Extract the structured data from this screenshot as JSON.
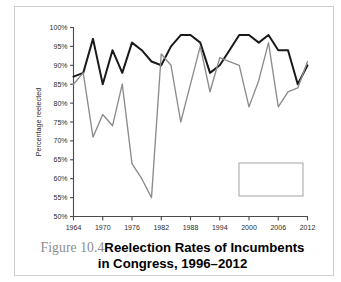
{
  "figure": {
    "caption_label": "Figure 10.4",
    "caption_title_line1": "Reelection Rates of Incumbents",
    "caption_title_line2": "in Congress, 1996–2012"
  },
  "colors": {
    "house": "#1a1a1a",
    "senate": "#8c8c8c",
    "axis": "#4a4a4a",
    "frame": "#cfcfcf",
    "background": "#ffffff",
    "caption_label": "#8d8d8d",
    "caption_title": "#000000"
  },
  "legend": {
    "position": "bottom-right",
    "entries": [
      {
        "label": "House",
        "color": "#1a1a1a"
      },
      {
        "label": "Senate",
        "color": "#8c8c8c"
      }
    ]
  },
  "chart_data": {
    "type": "line",
    "title": "Reelection Rates of Incumbents in Congress, 1996–2012",
    "xlabel": "",
    "ylabel": "Percentage reelected",
    "xlim": [
      1964,
      2012
    ],
    "ylim": [
      50,
      100
    ],
    "grid": false,
    "y_tick_labels": [
      "50%",
      "55%",
      "60%",
      "65%",
      "70%",
      "75%",
      "80%",
      "85%",
      "90%",
      "95%",
      "100%"
    ],
    "y_ticks": [
      50,
      55,
      60,
      65,
      70,
      75,
      80,
      85,
      90,
      95,
      100
    ],
    "x_tick_labels": [
      "1964",
      "1970",
      "1976",
      "1982",
      "1988",
      "1994",
      "2000",
      "2006",
      "2012"
    ],
    "x_ticks": [
      1964,
      1970,
      1976,
      1982,
      1988,
      1994,
      2000,
      2006,
      2012
    ],
    "x": [
      1964,
      1966,
      1968,
      1970,
      1972,
      1974,
      1976,
      1978,
      1980,
      1982,
      1984,
      1986,
      1988,
      1990,
      1992,
      1994,
      1996,
      1998,
      2000,
      2002,
      2004,
      2006,
      2008,
      2010,
      2012
    ],
    "series": [
      {
        "name": "House",
        "color": "#1a1a1a",
        "values": [
          87,
          88,
          97,
          85,
          94,
          88,
          96,
          94,
          91,
          90,
          95,
          98,
          98,
          96,
          88,
          90,
          94,
          98,
          98,
          96,
          98,
          94,
          94,
          85,
          90
        ]
      },
      {
        "name": "Senate",
        "color": "#8c8c8c",
        "values": [
          85,
          88,
          71,
          77,
          74,
          85,
          64,
          60,
          55,
          93,
          90,
          75,
          85,
          95,
          83,
          92,
          91,
          90,
          79,
          86,
          96,
          79,
          83,
          84,
          91
        ]
      }
    ]
  }
}
